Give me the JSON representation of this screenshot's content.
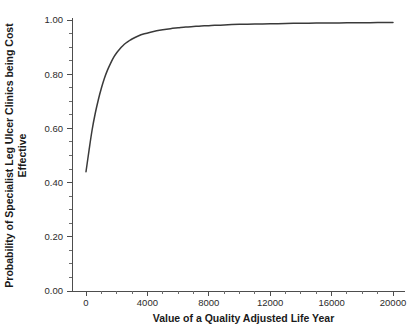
{
  "chart_data": {
    "type": "line",
    "title": "",
    "xlabel": "Value of a Quality Adjusted Life Year",
    "ylabel": "Probability of Specialist Leg Ulcer Clinics being Cost Effective",
    "ylabel_line1": "Probability of Specialist Leg Ulcer Clinics being Cost",
    "ylabel_line2": "Effective",
    "xlim": [
      0,
      21000
    ],
    "ylim": [
      0.0,
      1.0
    ],
    "grid": false,
    "legend": "none",
    "line_color": "#3a3a3a",
    "axis_color": "#4d4d4d",
    "background_color": "#ffffff",
    "xticks": [
      0,
      4000,
      8000,
      12000,
      16000,
      20000
    ],
    "xtick_labels": [
      "0",
      "4000",
      "8000",
      "12000",
      "16000",
      "20000"
    ],
    "xticks_minor_step": 1000,
    "yticks": [
      0.0,
      0.2,
      0.4,
      0.6,
      0.8,
      1.0
    ],
    "ytick_labels": [
      "0.00",
      "0.20",
      "0.40",
      "0.60",
      "0.80",
      "1.00"
    ],
    "yticks_minor_step": 0.05,
    "series": [
      {
        "name": "Probability cost effective",
        "x": [
          0,
          200,
          400,
          600,
          800,
          1000,
          1200,
          1400,
          1600,
          1800,
          2000,
          2200,
          2400,
          2600,
          2800,
          3000,
          3400,
          3800,
          4200,
          4600,
          5000,
          5500,
          6000,
          6500,
          7000,
          7500,
          8000,
          9000,
          10000,
          11000,
          12000,
          13000,
          14000,
          15000,
          16000,
          17000,
          18000,
          19000,
          20000
        ],
        "y": [
          0.44,
          0.52,
          0.595,
          0.655,
          0.705,
          0.748,
          0.785,
          0.815,
          0.84,
          0.862,
          0.879,
          0.893,
          0.905,
          0.915,
          0.923,
          0.93,
          0.941,
          0.949,
          0.955,
          0.96,
          0.964,
          0.968,
          0.971,
          0.974,
          0.976,
          0.978,
          0.979,
          0.982,
          0.984,
          0.985,
          0.986,
          0.987,
          0.988,
          0.9885,
          0.989,
          0.9895,
          0.99,
          0.9905,
          0.991
        ]
      }
    ]
  }
}
